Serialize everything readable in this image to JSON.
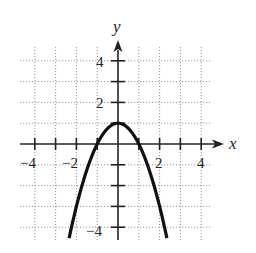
{
  "chart_data": {
    "type": "line",
    "title": "",
    "function": "y = 1 - x^2",
    "xlabel": "x",
    "ylabel": "y",
    "xlim": [
      -4.5,
      4.5
    ],
    "ylim": [
      -4.5,
      4.5
    ],
    "grid": true,
    "grid_style": "dotted",
    "x_ticks": [
      -4,
      -3,
      -2,
      -1,
      1,
      2,
      3,
      4
    ],
    "y_ticks": [
      -4,
      -3,
      -2,
      -1,
      1,
      2,
      3,
      4
    ],
    "x_tick_labels": [
      "-4",
      "-2",
      "2",
      "4"
    ],
    "y_tick_labels": [
      "4",
      "2",
      "-4"
    ],
    "series": [
      {
        "name": "parabola",
        "x": [
          -2.35,
          -2,
          -1.5,
          -1,
          -0.5,
          0,
          0.5,
          1,
          1.5,
          2,
          2.35
        ],
        "y": [
          -4.52,
          -3,
          -1.25,
          0,
          0.75,
          1,
          0.75,
          0,
          -1.25,
          -3,
          -4.52
        ]
      }
    ],
    "vertex": [
      0,
      1
    ],
    "x_intercepts": [
      -1,
      1
    ],
    "legend": null
  },
  "labels": {
    "x_axis": "x",
    "y_axis": "y",
    "x_neg4": "−4",
    "x_neg2": "−2",
    "x_2": "2",
    "x_4": "4",
    "y_4": "4",
    "y_2": "2",
    "y_neg4": "−4"
  },
  "colors": {
    "curve": "#111111",
    "axis": "#222222",
    "grid": "#9a9a9a"
  }
}
